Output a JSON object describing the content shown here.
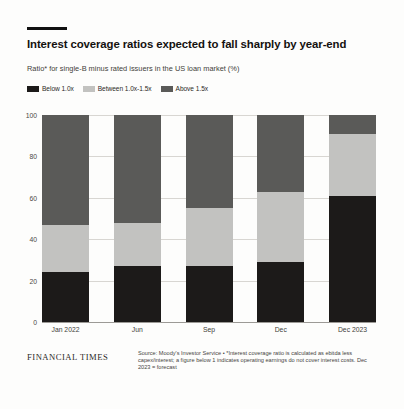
{
  "header": {
    "title": "Interest coverage ratios expected to fall sharply by year-end",
    "subtitle": "Ratio* for single-B minus rated issuers in the US loan market (%)"
  },
  "footer": {
    "brand": "FINANCIAL TIMES",
    "source": "Source: Moody's Investor Service • *Interest coverage ratio is calculated as ebitda less capex/interest; a figure below 1 indicates operating earnings do not cover interest costs. Dec 2023 = forecast"
  },
  "colors": {
    "below": "#1c1a19",
    "between": "#c2c2c0",
    "above": "#5a5a58",
    "background": "#fdfdfc",
    "grid": "#d8d6d2"
  },
  "chart_data": {
    "type": "bar",
    "stacked": true,
    "title": "Interest coverage ratios expected to fall sharply by year-end",
    "subtitle": "Ratio* for single-B minus rated issuers in the US loan market (%)",
    "xlabel": "",
    "ylabel": "",
    "ylim": [
      0,
      100
    ],
    "yticks": [
      0,
      20,
      40,
      60,
      80,
      100
    ],
    "grid": true,
    "legend_position": "top-left",
    "categories": [
      "Jan 2022",
      "Jun",
      "Sep",
      "Dec",
      "Dec 2023"
    ],
    "series": [
      {
        "name": "Below 1.0x",
        "color": "#1c1a19",
        "values": [
          24,
          27,
          27,
          29,
          61
        ]
      },
      {
        "name": "Between 1.0x-1.5x",
        "color": "#c2c2c0",
        "values": [
          23,
          21,
          28,
          34,
          30
        ]
      },
      {
        "name": "Above 1.5x",
        "color": "#5a5a58",
        "values": [
          53,
          52,
          45,
          37,
          9
        ]
      }
    ]
  }
}
